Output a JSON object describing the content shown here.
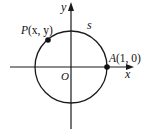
{
  "diagram": {
    "type": "unit-circle",
    "axes": {
      "x_label": "x",
      "y_label": "y",
      "origin_label": "O"
    },
    "circle": {
      "center": [
        71,
        67
      ],
      "radius": 36,
      "stroke": "#1a1a1a"
    },
    "points": [
      {
        "id": "P",
        "text_name": "P",
        "text_args": "(x, y)",
        "pos": [
          48,
          40
        ]
      },
      {
        "id": "A",
        "text_name": "A",
        "text_args": "(1, 0)",
        "pos": [
          107,
          67
        ]
      }
    ],
    "arc_label": "s",
    "colors": {
      "ink": "#1a1a1a",
      "background": "#ffffff"
    }
  }
}
